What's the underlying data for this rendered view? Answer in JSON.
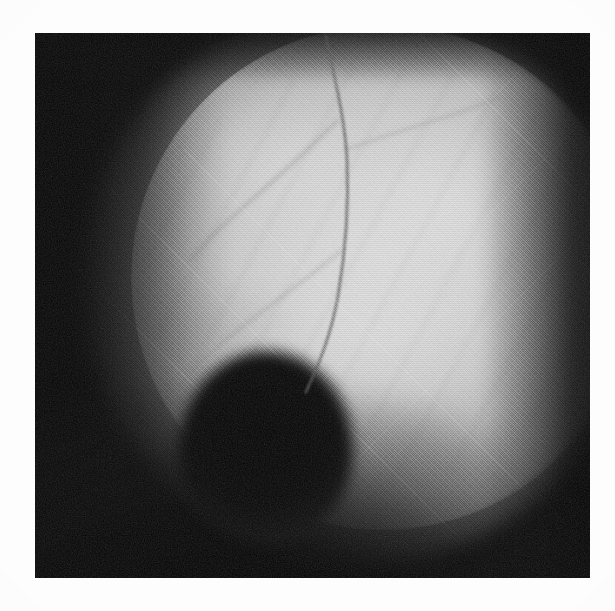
{
  "page": {
    "background_color": "#fdfdfd",
    "width": 615,
    "height": 611,
    "caption": ""
  },
  "figure": {
    "kind": "photograph",
    "modality": "grayscale ophthalmoscopic fundus photograph",
    "print_style": "halftone screened reproduction",
    "plate": {
      "label": "photographic plate",
      "x": 35,
      "y": 33,
      "width": 555,
      "height": 545,
      "background_color": "#050505"
    },
    "regions": [
      {
        "name": "illuminated-disc",
        "label": "Illuminated circular fundus field",
        "center_x": 330,
        "center_y": 270,
        "radius": 255,
        "highlight_color": "#e4e4e4",
        "mid_tone_color": "#c4c4c4",
        "edge_tone_color": "#3a3a3a",
        "edge_character": "sharp on the right, diffuse on the left and bottom"
      },
      {
        "name": "dark-shadow-blob",
        "label": "Dark round shadow at lower left of the field",
        "center_x": 265,
        "center_y": 445,
        "radius_x": 88,
        "radius_y": 95,
        "color": "#050505"
      },
      {
        "name": "bright-core",
        "label": "Brightest highlight of the retinal field",
        "center_x": 430,
        "center_y": 250,
        "color": "#e4e4e4"
      },
      {
        "name": "dark-surround",
        "label": "Unilluminated dark surround",
        "color": "#050505"
      }
    ],
    "vessels": [
      {
        "name": "main-vessel-trunk",
        "label": "Primary retinal vessel descending to the shadow",
        "color": "#5e5e5e",
        "width": 3.0,
        "path": "M 326 36 C 332 70, 344 110, 347 158 C 349 206, 346 250, 338 296 C 331 336, 318 366, 306 392"
      },
      {
        "name": "vessel-branch-upper",
        "label": "Upper branch diverging toward the left",
        "color": "#6a6a6a",
        "width": 2.0,
        "path": "M 338 120 C 318 140, 288 168, 256 196 C 228 220, 206 240, 188 262"
      },
      {
        "name": "vessel-branch-lower",
        "label": "Lower branch diverging toward the lower left",
        "color": "#707070",
        "width": 1.8,
        "path": "M 342 250 C 318 270, 288 292, 256 316 C 230 336, 208 354, 190 372"
      },
      {
        "name": "vessel-branch-right",
        "label": "Faint branch curving toward the upper right",
        "color": "#767676",
        "width": 1.6,
        "path": "M 345 150 C 372 140, 404 130, 436 120 C 462 112, 484 104, 502 96"
      }
    ],
    "grain": {
      "name": "halftone-grain",
      "label": "Halftone dot and film grain texture",
      "opacity": 0.3
    }
  }
}
